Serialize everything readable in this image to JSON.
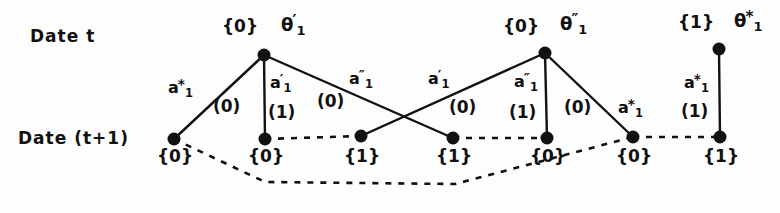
{
  "figure": {
    "row_labels": [
      {
        "id": "date-t",
        "text": "Date  t",
        "x": 30,
        "y": 28
      },
      {
        "id": "date-t1",
        "text": "Date  (t+1)",
        "x": 18,
        "y": 130
      }
    ],
    "top_nodes": [
      {
        "id": "theta-prime",
        "cx": 264,
        "cy": 55,
        "state": "{0}",
        "state_x": 222,
        "state_y": 18,
        "theta_label": "θ",
        "theta_sub": "1",
        "theta_sup": "′",
        "theta_x": 281,
        "theta_y": 14
      },
      {
        "id": "theta-double-prime",
        "cx": 545,
        "cy": 53,
        "state": "{0}",
        "state_x": 503,
        "state_y": 18,
        "theta_label": "θ",
        "theta_sub": "1",
        "theta_sup": "″",
        "theta_x": 560,
        "theta_y": 13
      },
      {
        "id": "theta-star",
        "cx": 719,
        "cy": 49,
        "state": "{1}",
        "state_x": 678,
        "state_y": 14,
        "theta_label": "θ",
        "theta_sub": "1",
        "theta_sup": "*",
        "theta_x": 734,
        "theta_y": 10
      }
    ],
    "bottom_nodes": [
      {
        "id": "b1",
        "cx": 174,
        "cy": 139,
        "state": "{0}",
        "state_x": 157,
        "state_y": 148
      },
      {
        "id": "b2",
        "cx": 265,
        "cy": 139,
        "state": "{0}",
        "state_x": 248,
        "state_y": 148
      },
      {
        "id": "b3",
        "cx": 361,
        "cy": 136,
        "state": "{1}",
        "state_x": 344,
        "state_y": 148
      },
      {
        "id": "b4",
        "cx": 453,
        "cy": 138,
        "state": "{1}",
        "state_x": 436,
        "state_y": 148
      },
      {
        "id": "b5",
        "cx": 547,
        "cy": 138,
        "state": "{0}",
        "state_x": 530,
        "state_y": 148
      },
      {
        "id": "b6",
        "cx": 633,
        "cy": 137,
        "state": "{0}",
        "state_x": 616,
        "state_y": 148
      },
      {
        "id": "b7",
        "cx": 720,
        "cy": 137,
        "state": "{1}",
        "state_x": 703,
        "state_y": 148
      }
    ],
    "solid_edges": [
      {
        "id": "e-theta1-b1",
        "x1": 264,
        "y1": 55,
        "x2": 174,
        "y2": 139
      },
      {
        "id": "e-theta1-b2",
        "x1": 264,
        "y1": 55,
        "x2": 265,
        "y2": 139
      },
      {
        "id": "e-theta1-b4",
        "x1": 264,
        "y1": 55,
        "x2": 453,
        "y2": 138
      },
      {
        "id": "e-b3-theta2",
        "x1": 361,
        "y1": 136,
        "x2": 545,
        "y2": 53
      },
      {
        "id": "e-theta2-b5",
        "x1": 545,
        "y1": 53,
        "x2": 547,
        "y2": 138
      },
      {
        "id": "e-theta2-b6",
        "x1": 545,
        "y1": 53,
        "x2": 633,
        "y2": 137
      },
      {
        "id": "e-theta3-b7",
        "x1": 719,
        "y1": 49,
        "x2": 720,
        "y2": 137
      }
    ],
    "dashed_edges": [
      {
        "id": "d-b2-b3",
        "points": "265,139 361,136"
      },
      {
        "id": "d-b4-b5",
        "points": "453,138 547,138"
      },
      {
        "id": "d-b6-b7",
        "points": "633,137 720,137"
      },
      {
        "id": "d-b1-long-b6",
        "points": "174,139 265,182 455,184 633,137"
      }
    ],
    "action_labels": [
      {
        "id": "a-star-1",
        "base": "a",
        "sub": "1",
        "sup": "*",
        "x": 168,
        "y": 78
      },
      {
        "id": "a-prime-1",
        "base": "a",
        "sub": "1",
        "sup": "′",
        "x": 270,
        "y": 73
      },
      {
        "id": "a-dprime-1",
        "base": "a",
        "sub": "1",
        "sup": "″",
        "x": 349,
        "y": 69
      },
      {
        "id": "a-prime-2",
        "base": "a",
        "sub": "1",
        "sup": "′",
        "x": 428,
        "y": 69
      },
      {
        "id": "a-dprime-2",
        "base": "a",
        "sub": "1",
        "sup": "″",
        "x": 514,
        "y": 72
      },
      {
        "id": "a-star-2",
        "base": "a",
        "sub": "1",
        "sup": "*",
        "x": 618,
        "y": 98
      },
      {
        "id": "a-star-3",
        "base": "a",
        "sub": "1",
        "sup": "*",
        "x": 684,
        "y": 73
      }
    ],
    "cost_labels": [
      {
        "id": "c1",
        "text": "(0)",
        "x": 213,
        "y": 98
      },
      {
        "id": "c2",
        "text": "(1)",
        "x": 268,
        "y": 104
      },
      {
        "id": "c3",
        "text": "(0)",
        "x": 317,
        "y": 93
      },
      {
        "id": "c4",
        "text": "(0)",
        "x": 449,
        "y": 99
      },
      {
        "id": "c5",
        "text": "(1)",
        "x": 509,
        "y": 104
      },
      {
        "id": "c6",
        "text": "(0)",
        "x": 564,
        "y": 99
      },
      {
        "id": "c7",
        "text": "(1)",
        "x": 681,
        "y": 103
      }
    ],
    "style": {
      "ink": "#111111",
      "background": "#fdfdfd",
      "node_radius": 6.5,
      "solid_stroke_width": 2.4,
      "dashed_stroke_width": 2.6,
      "dash_pattern": "6,7"
    }
  }
}
